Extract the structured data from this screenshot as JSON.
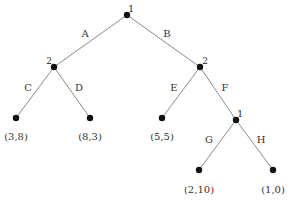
{
  "diagram": {
    "type": "game-tree",
    "nodes": [
      {
        "id": "n_root",
        "kind": "decision",
        "player": "1",
        "x": 127,
        "y": 15,
        "label_x": 131,
        "label_y": 9
      },
      {
        "id": "n_left2",
        "kind": "decision",
        "player": "2",
        "x": 54,
        "y": 67,
        "label_x": 49,
        "label_y": 61
      },
      {
        "id": "n_right2",
        "kind": "decision",
        "player": "2",
        "x": 200,
        "y": 67,
        "label_x": 205,
        "label_y": 61
      },
      {
        "id": "n_low1",
        "kind": "decision",
        "player": "1",
        "x": 236,
        "y": 120,
        "label_x": 240,
        "label_y": 114
      },
      {
        "id": "leaf_C",
        "kind": "terminal",
        "payoff": "(3,8)",
        "x": 16,
        "y": 118,
        "label_x": 16,
        "label_y": 137
      },
      {
        "id": "leaf_D",
        "kind": "terminal",
        "payoff": "(8,3)",
        "x": 90,
        "y": 118,
        "label_x": 90,
        "label_y": 137
      },
      {
        "id": "leaf_E",
        "kind": "terminal",
        "payoff": "(5,5)",
        "x": 162,
        "y": 118,
        "label_x": 162,
        "label_y": 137
      },
      {
        "id": "leaf_G",
        "kind": "terminal",
        "payoff": "(2,10)",
        "x": 199,
        "y": 170,
        "label_x": 199,
        "label_y": 190
      },
      {
        "id": "leaf_H",
        "kind": "terminal",
        "payoff": "(1,0)",
        "x": 273,
        "y": 170,
        "label_x": 273,
        "label_y": 190
      }
    ],
    "edges": [
      {
        "from": "n_root",
        "to": "n_left2",
        "action": "A",
        "label_x": 85,
        "label_y": 34
      },
      {
        "from": "n_root",
        "to": "n_right2",
        "action": "B",
        "label_x": 167,
        "label_y": 34
      },
      {
        "from": "n_left2",
        "to": "leaf_C",
        "action": "C",
        "label_x": 28,
        "label_y": 88
      },
      {
        "from": "n_left2",
        "to": "leaf_D",
        "action": "D",
        "label_x": 79,
        "label_y": 88
      },
      {
        "from": "n_right2",
        "to": "leaf_E",
        "action": "E",
        "label_x": 174,
        "label_y": 88
      },
      {
        "from": "n_right2",
        "to": "n_low1",
        "action": "F",
        "label_x": 225,
        "label_y": 88
      },
      {
        "from": "n_low1",
        "to": "leaf_G",
        "action": "G",
        "label_x": 209,
        "label_y": 140
      },
      {
        "from": "n_low1",
        "to": "leaf_H",
        "action": "H",
        "label_x": 261,
        "label_y": 140
      }
    ]
  },
  "colors": {
    "edge": "#8a8a8a",
    "node": "#111111",
    "text": "#333333",
    "background": "#ffffff"
  }
}
